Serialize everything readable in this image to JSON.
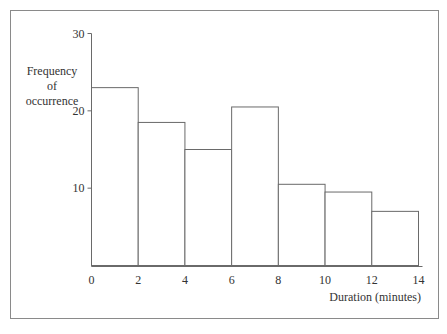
{
  "chart_data": {
    "type": "bar",
    "subtype": "histogram",
    "title": "",
    "xlabel": "Duration (minutes)",
    "ylabel_lines": [
      "Frequency",
      "of",
      "occurrence"
    ],
    "bins": [
      {
        "from": 0,
        "to": 2,
        "value": 23
      },
      {
        "from": 2,
        "to": 4,
        "value": 18.5
      },
      {
        "from": 4,
        "to": 6,
        "value": 15
      },
      {
        "from": 6,
        "to": 8,
        "value": 20.5
      },
      {
        "from": 8,
        "to": 10,
        "value": 10.5
      },
      {
        "from": 10,
        "to": 12,
        "value": 9.5
      },
      {
        "from": 12,
        "to": 14,
        "value": 7
      }
    ],
    "x_ticks": [
      "0",
      "2",
      "4",
      "6",
      "8",
      "10",
      "12",
      "14"
    ],
    "y_ticks": [
      "10",
      "20",
      "30"
    ],
    "xlim": [
      0,
      14
    ],
    "ylim": [
      0,
      30
    ],
    "grid": false,
    "legend": "none"
  }
}
